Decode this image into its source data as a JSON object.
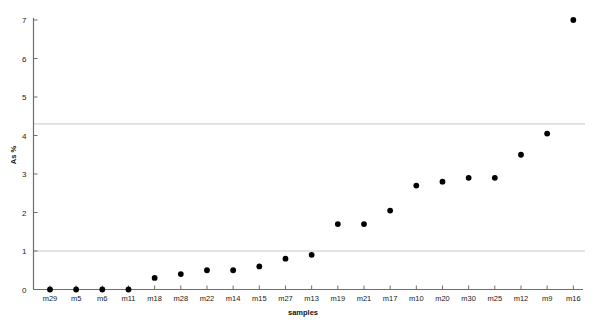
{
  "chart_data": {
    "type": "scatter",
    "title": "",
    "xlabel": "samples",
    "ylabel": "As %",
    "ylim": [
      0,
      7
    ],
    "yticks": [
      0,
      1,
      2,
      3,
      4,
      5,
      6,
      7
    ],
    "ytick_labels": [
      "0",
      "1",
      "2",
      "3",
      "4",
      "5",
      "6",
      "7"
    ],
    "grid": false,
    "legend": null,
    "categories": [
      "m29",
      "m5",
      "m6",
      "m11",
      "m18",
      "m28",
      "m22",
      "m14",
      "m15",
      "m27",
      "m13",
      "m19",
      "m21",
      "m17",
      "m10",
      "m20",
      "m30",
      "m25",
      "m12",
      "m9",
      "m16"
    ],
    "values": [
      0.0,
      0.0,
      0.0,
      0.0,
      0.3,
      0.4,
      0.5,
      0.5,
      0.6,
      0.8,
      0.9,
      1.7,
      1.7,
      2.05,
      2.7,
      2.8,
      2.9,
      2.9,
      3.5,
      4.05,
      7.0
    ],
    "series": [
      {
        "name": "As %",
        "marker": "filled-circle",
        "color": "#000000",
        "values": [
          0.0,
          0.0,
          0.0,
          0.0,
          0.3,
          0.4,
          0.5,
          0.5,
          0.6,
          0.8,
          0.9,
          1.7,
          1.7,
          2.05,
          2.7,
          2.8,
          2.9,
          2.9,
          3.5,
          4.05,
          7.0
        ]
      }
    ],
    "reference_lines": [
      {
        "name": "upper-reference-line",
        "value": 4.3,
        "color": "#c8c8c8"
      },
      {
        "name": "lower-reference-line",
        "value": 1.0,
        "color": "#c8c8c8"
      }
    ]
  }
}
